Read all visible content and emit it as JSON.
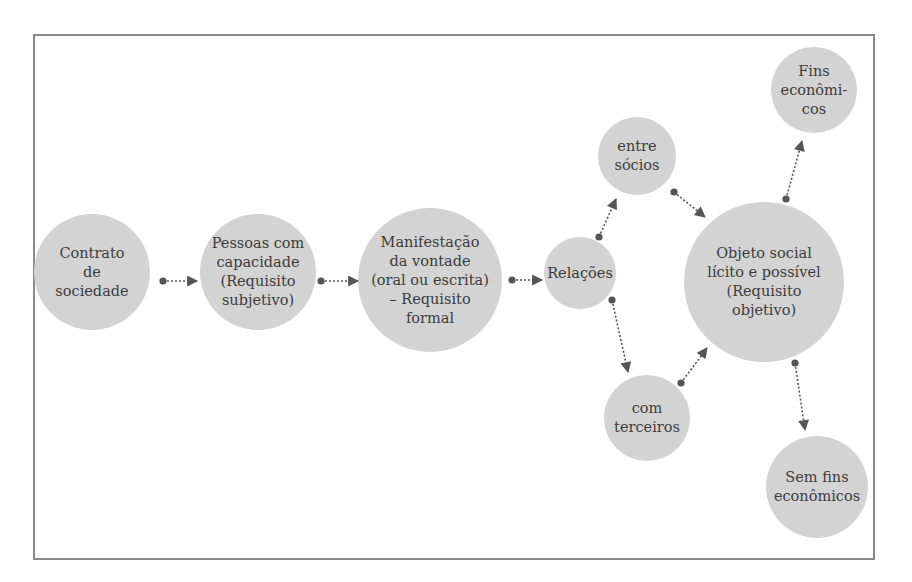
{
  "diagram": {
    "colors": {
      "node_fill": "#d3d3d3",
      "edge": "#555555",
      "text": "#3c3c3c",
      "frame": "#8a8a8a"
    },
    "nodes": [
      {
        "id": "contrato",
        "label": "Contrato\nde\nsociedade",
        "cx": 92,
        "cy": 272,
        "r": 58
      },
      {
        "id": "pessoas",
        "label": "Pessoas com\ncapacidade\n(Requisito\nsubjetivo)",
        "cx": 258,
        "cy": 272,
        "r": 58
      },
      {
        "id": "manifestacao",
        "label": "Manifestação\nda vontade\n(oral ou escrita)\n– Requisito\nformal",
        "cx": 430,
        "cy": 280,
        "r": 72
      },
      {
        "id": "relacoes",
        "label": "Relações",
        "cx": 580,
        "cy": 273,
        "r": 36
      },
      {
        "id": "entre_socios",
        "label": "entre\nsócios",
        "cx": 637,
        "cy": 156,
        "r": 39
      },
      {
        "id": "com_terceiros",
        "label": "com\nterceiros",
        "cx": 647,
        "cy": 418,
        "r": 43
      },
      {
        "id": "objeto_social",
        "label": "Objeto social\nlícito e possível\n(Requisito\nobjetivo)",
        "cx": 764,
        "cy": 282,
        "r": 80
      },
      {
        "id": "fins_economicos",
        "label": "Fins\neconômi-\ncos",
        "cx": 814,
        "cy": 90,
        "r": 43
      },
      {
        "id": "sem_fins",
        "label": "Sem fins\neconômicos",
        "cx": 817,
        "cy": 487,
        "r": 51
      }
    ],
    "edges": [
      {
        "from": "contrato",
        "to": "pessoas",
        "x1": 163,
        "y1": 281,
        "x2": 197,
        "y2": 281
      },
      {
        "from": "pessoas",
        "to": "manifestacao",
        "x1": 321,
        "y1": 281,
        "x2": 358,
        "y2": 281
      },
      {
        "from": "manifestacao",
        "to": "relacoes",
        "x1": 512,
        "y1": 280,
        "x2": 542,
        "y2": 280
      },
      {
        "from": "relacoes",
        "to": "entre_socios",
        "x1": 599,
        "y1": 237,
        "x2": 616,
        "y2": 199
      },
      {
        "from": "relacoes",
        "to": "com_terceiros",
        "x1": 612,
        "y1": 300,
        "x2": 628,
        "y2": 372
      },
      {
        "from": "entre_socios",
        "to": "objeto_social",
        "x1": 674,
        "y1": 192,
        "x2": 705,
        "y2": 217
      },
      {
        "from": "com_terceiros",
        "to": "objeto_social",
        "x1": 681,
        "y1": 383,
        "x2": 707,
        "y2": 348
      },
      {
        "from": "objeto_social",
        "to": "fins_economicos",
        "x1": 786,
        "y1": 199,
        "x2": 802,
        "y2": 141
      },
      {
        "from": "objeto_social",
        "to": "sem_fins",
        "x1": 795,
        "y1": 363,
        "x2": 805,
        "y2": 430
      }
    ]
  }
}
